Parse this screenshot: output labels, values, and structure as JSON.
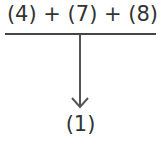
{
  "diagram": {
    "numerator": "(4) + (7) + (8)",
    "result": "(1)",
    "arrow_direction": "down",
    "line_color": "#444444",
    "text_color": "#333333"
  }
}
